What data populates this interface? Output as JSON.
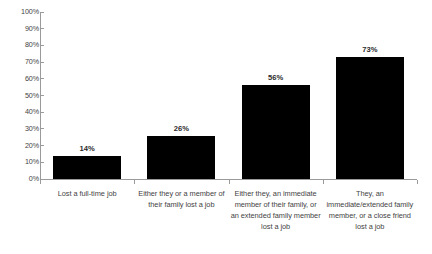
{
  "chart_data": {
    "type": "bar",
    "title": "",
    "xlabel": "",
    "ylabel": "",
    "ylim": [
      0,
      100
    ],
    "grid": false,
    "legend": "none",
    "bar_color": "#000000",
    "axis_color": "#9a9a9a",
    "categories": [
      "Lost a full-time job",
      "Either they or a member of their family lost a job",
      "Either they, an immediate member of their family, or an extended family member lost a job",
      "They, an immediate/extended family member, or a close friend lost a job"
    ],
    "values": [
      14,
      26,
      56,
      73
    ],
    "data_labels": [
      "14%",
      "26%",
      "56%",
      "73%"
    ],
    "yticks": [
      0,
      10,
      20,
      30,
      40,
      50,
      60,
      70,
      80,
      90,
      100
    ],
    "ytick_labels": [
      "0%",
      "10%",
      "20%",
      "30%",
      "40%",
      "50%",
      "60%",
      "70%",
      "80%",
      "90%",
      "100%"
    ]
  }
}
